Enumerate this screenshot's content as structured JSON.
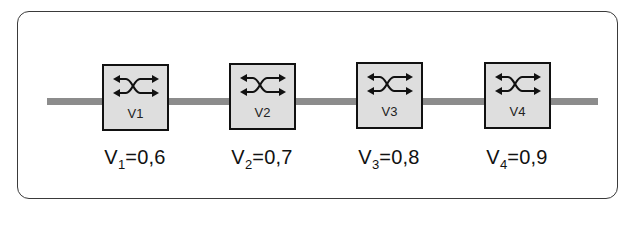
{
  "diagram": {
    "type": "network-switch-chain",
    "bus": {
      "color": "#8c8c8c",
      "description": "horizontal shared link"
    },
    "switches": [
      {
        "id": "V1",
        "label": "V1",
        "value_prefix": "V",
        "value_sub": "1",
        "value_text": "=0,6",
        "value": 0.6
      },
      {
        "id": "V2",
        "label": "V2",
        "value_prefix": "V",
        "value_sub": "2",
        "value_text": "=0,7",
        "value": 0.7
      },
      {
        "id": "V3",
        "label": "V3",
        "value_prefix": "V",
        "value_sub": "3",
        "value_text": "=0,8",
        "value": 0.8
      },
      {
        "id": "V4",
        "label": "V4",
        "value_prefix": "V",
        "value_sub": "4",
        "value_text": "=0,9",
        "value": 0.9
      }
    ],
    "icon": "switch-crossed-arrows-icon",
    "colors": {
      "box_fill": "#dedede",
      "box_border": "#111111",
      "frame_border": "#3a3a3a"
    }
  }
}
